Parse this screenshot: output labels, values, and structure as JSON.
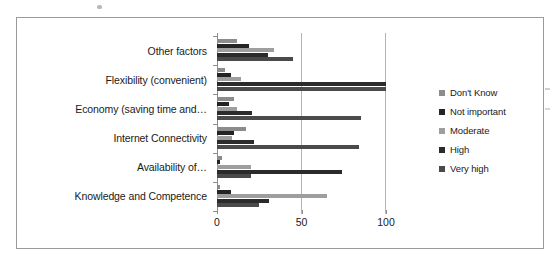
{
  "chart_data": {
    "type": "bar",
    "orientation": "horizontal",
    "title": "",
    "xlabel": "",
    "ylabel": "",
    "xlim": [
      0,
      100
    ],
    "xticks": [
      0,
      50,
      100
    ],
    "xtick_labels": [
      "0",
      "50",
      "100"
    ],
    "grid": true,
    "grid_axis": "x",
    "legend_position": "right",
    "categories": [
      "Other factors",
      "Flexibility (convenient)",
      "Economy (saving time and…",
      "Internet Connectivity",
      "Availability of…",
      "Knowledge and Competence"
    ],
    "series": [
      {
        "name": "Don't Know",
        "color": "#8c8c8c",
        "values": [
          12,
          5,
          10,
          17,
          3,
          2
        ]
      },
      {
        "name": "Not important",
        "color": "#242424",
        "values": [
          19,
          8,
          7,
          10,
          2,
          8
        ]
      },
      {
        "name": "Moderate",
        "color": "#9e9e9e",
        "values": [
          34,
          14,
          12,
          9,
          20,
          65
        ]
      },
      {
        "name": "High",
        "color": "#2b2b2b",
        "values": [
          30,
          100,
          21,
          22,
          74,
          31
        ]
      },
      {
        "name": "Very high",
        "color": "#4a4a4a",
        "values": [
          45,
          100,
          85,
          84,
          20,
          25
        ]
      }
    ]
  },
  "legend": {
    "items": [
      {
        "label": "Don't Know",
        "color": "#8c8c8c"
      },
      {
        "label": "Not important",
        "color": "#242424"
      },
      {
        "label": "Moderate",
        "color": "#9e9e9e"
      },
      {
        "label": "High",
        "color": "#2b2b2b"
      },
      {
        "label": "Very high",
        "color": "#4a4a4a"
      }
    ]
  }
}
